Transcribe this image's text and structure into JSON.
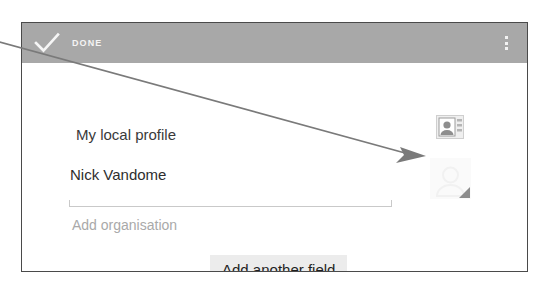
{
  "window": {
    "kind": "android-contact-editor-screenshot"
  },
  "action_bar": {
    "confirm_icon": "check-icon",
    "confirm_label": "DONE",
    "overflow_icon": "overflow-menu-icon",
    "background_color": "#a8a8a8",
    "label_color": "#f4f4f4"
  },
  "form": {
    "account_row": {
      "icon": "contact-card-icon",
      "label": "My local profile"
    },
    "name_row": {
      "value": "Nick Vandome",
      "avatar_icon": "avatar-placeholder-icon",
      "has_underline": true
    },
    "organisation_row": {
      "placeholder": "Add organisation"
    },
    "add_field_button": {
      "label": "Add another field",
      "background_color": "#ececec"
    }
  },
  "annotation": {
    "type": "callout-arrow",
    "color": "#6e6e6e",
    "description": "diagonal pointer line from upper-left off-screen to the avatar thumbnail"
  }
}
